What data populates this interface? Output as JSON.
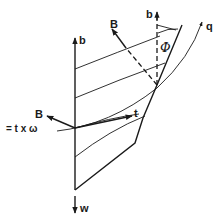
{
  "figure": {
    "labels": {
      "b_left": "b",
      "b_right": "b",
      "B_top": "B",
      "B_left": "B",
      "B_def": "= t x ω",
      "t": "t",
      "phi": "Φ",
      "q": "q",
      "w": "w"
    },
    "colors": {
      "ink": "#1a1a1a",
      "background": "#ffffff"
    }
  }
}
